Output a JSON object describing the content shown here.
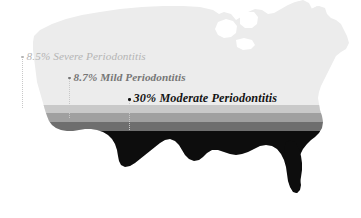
{
  "figure": {
    "background_color": "#ffffff"
  },
  "map": {
    "region_name": "United States",
    "base_fill": "#ececec",
    "outline_name": "usa-silhouette"
  },
  "labels": [
    {
      "id": "severe",
      "bullet_name": "bullet-severe",
      "leader_name": "leader-line-severe",
      "text": "8.5% Severe Periodontitis",
      "value": 8.5,
      "unit": "%",
      "category": "Severe Periodontitis",
      "color": "#b4b4b4"
    },
    {
      "id": "mild",
      "bullet_name": "bullet-mild",
      "leader_name": "leader-line-mild",
      "text": "8.7% Mild Periodontitis",
      "value": 8.7,
      "unit": "%",
      "category": "Mild Periodontitis",
      "color": "#767676"
    },
    {
      "id": "moderate",
      "bullet_name": "bullet-moderate",
      "leader_name": "leader-line-moderate",
      "text": "30% Moderate Periodontitis",
      "value": 30,
      "unit": "%",
      "category": "Moderate Periodontitis",
      "color": "#141414"
    }
  ],
  "bands": [
    {
      "name": "band-severe",
      "category": "Severe Periodontitis",
      "color": "#c9c9c9",
      "y_top": 105,
      "y_bottom": 113
    },
    {
      "name": "band-mild",
      "category": "Mild Periodontitis",
      "color": "#a0a0a0",
      "y_top": 113,
      "y_bottom": 122
    },
    {
      "name": "band-moderate",
      "category": "Moderate Periodontitis",
      "color": "#6e6e6e",
      "y_top": 122,
      "y_bottom": 131
    },
    {
      "name": "band-base",
      "category": "Remaining",
      "color": "#0d0d0d",
      "y_top": 131,
      "y_bottom": 218
    }
  ],
  "chart_data": {
    "type": "bar",
    "subtitle": "",
    "xlabel": "",
    "ylabel": "Prevalence (%)",
    "categories": [
      "Severe Periodontitis",
      "Mild Periodontitis",
      "Moderate Periodontitis"
    ],
    "values": [
      8.5,
      8.7,
      30
    ],
    "value_labels": [
      "8.5%",
      "8.7%",
      "30%"
    ],
    "colors": [
      "#c9c9c9",
      "#a0a0a0",
      "#6e6e6e"
    ],
    "ylim": [
      0,
      100
    ],
    "grid": false,
    "legend": "none",
    "annotations": [
      "8.5% Severe Periodontitis",
      "8.7% Mild Periodontitis",
      "30% Moderate Periodontitis"
    ],
    "note": "Stacked horizontal grayscale bands filling a United States silhouette from the bottom upward; band thickness is proportional to each prevalence value."
  }
}
